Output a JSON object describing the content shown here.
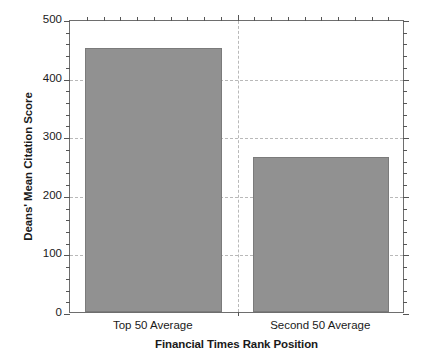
{
  "chart_data": {
    "type": "bar",
    "title": "",
    "categories": [
      "Top 50 Average",
      "Second 50 Average"
    ],
    "values": [
      450,
      265
    ],
    "xlabel": "Financial Times Rank Position",
    "ylabel": "Deans' Mean Citation Score",
    "ylim": [
      0,
      500
    ],
    "yticks": [
      0,
      100,
      200,
      300,
      400,
      500
    ],
    "ytick_labels": [
      "0",
      "100",
      "200",
      "300",
      "400",
      "500"
    ],
    "y_minor_tick_step": 20,
    "grid": {
      "horizontal": true,
      "vertical": true,
      "horizontal_at": [
        100,
        200,
        300,
        400
      ],
      "style": "dashed",
      "color": "#b9b9b9"
    },
    "legend": null,
    "legend_position": "none",
    "bar_color": "#919191",
    "bar_edge_color": "#7b7b7b",
    "axis_color": "#6e6e6e",
    "background": "#ffffff",
    "series": [
      {
        "name": "Deans' Mean Citation Score",
        "values": [
          450,
          265
        ]
      }
    ]
  }
}
